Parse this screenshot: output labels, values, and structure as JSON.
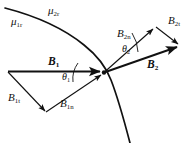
{
  "figure": {
    "type": "physics-vector-diagram",
    "background_color": "#ffffff",
    "stroke_color": "#111111"
  },
  "labels": {
    "mu_1r": {
      "symbol": "μ",
      "sub": "1r",
      "x": 11,
      "y": 17
    },
    "mu_2r": {
      "symbol": "μ",
      "sub": "2r",
      "x": 47,
      "y": 6
    },
    "B_1": {
      "symbol": "B",
      "sub": "1",
      "x": 47,
      "y": 56
    },
    "B_1t": {
      "symbol": "B",
      "sub": "1t",
      "x": 8,
      "y": 92
    },
    "B_1n": {
      "symbol": "B",
      "sub": "1n",
      "x": 59,
      "y": 98
    },
    "theta_1": {
      "symbol": "θ",
      "sub": "1",
      "x": 62,
      "y": 72
    },
    "B_2": {
      "symbol": "B",
      "sub": "2",
      "x": 146,
      "y": 60
    },
    "B_2n": {
      "symbol": "B",
      "sub": "2n",
      "x": 117,
      "y": 29
    },
    "B_2t": {
      "symbol": "B",
      "sub": "2t",
      "x": 167,
      "y": 16
    },
    "theta_2": {
      "symbol": "θ",
      "sub": "2",
      "x": 121,
      "y": 45
    }
  },
  "geometry": {
    "boundary_arc": "M 5,8 C 40,18 78,38 100,65 C 112,82 122,112 130,143",
    "junction_point": {
      "x": 104,
      "y": 72
    },
    "vectors": [
      {
        "name": "B1",
        "from": [
          8,
          72
        ],
        "to": [
          104,
          72
        ],
        "style": "bold"
      },
      {
        "name": "B1t",
        "from": [
          8,
          72
        ],
        "to": [
          46,
          112
        ],
        "style": "thin"
      },
      {
        "name": "B1n",
        "from": [
          46,
          112
        ],
        "to": [
          104,
          73
        ],
        "style": "thin"
      },
      {
        "name": "B2",
        "from": [
          104,
          72
        ],
        "to": [
          181,
          45
        ],
        "style": "bold"
      },
      {
        "name": "B2n",
        "from": [
          104,
          72
        ],
        "to": [
          156,
          27
        ],
        "style": "thin"
      },
      {
        "name": "B2t",
        "from": [
          156,
          27
        ],
        "to": [
          181,
          45
        ],
        "style": "thin"
      }
    ],
    "angle_arcs": [
      {
        "name": "theta1",
        "path": "M 76,66 A 30,30 0 0,1 73,82"
      },
      {
        "name": "theta2",
        "path": "M 136,48 A 36,36 0 0,0 131,34"
      }
    ]
  }
}
